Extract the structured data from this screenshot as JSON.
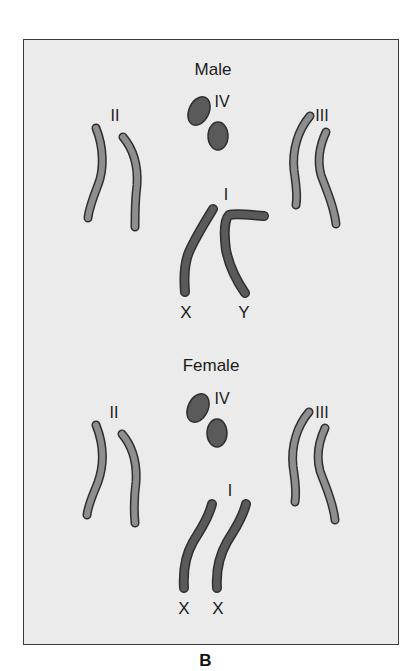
{
  "figure": {
    "caption": "B",
    "colors": {
      "background": "#ebebeb",
      "frame_border": "#3a3a3a",
      "light_chromosome": "#8e8e8e",
      "dark_chromosome": "#5a5a5a",
      "outline": "#2f2f2f",
      "text": "#1a1a1a"
    },
    "panels": [
      {
        "title": "Male",
        "chromosome_labels": {
          "pair_2": "II",
          "pair_3": "III",
          "pair_4": "IV",
          "pair_1": "I"
        },
        "sex_labels": [
          "X",
          "Y"
        ]
      },
      {
        "title": "Female",
        "chromosome_labels": {
          "pair_2": "II",
          "pair_3": "III",
          "pair_4": "IV",
          "pair_1": "I"
        },
        "sex_labels": [
          "X",
          "X"
        ]
      }
    ]
  }
}
